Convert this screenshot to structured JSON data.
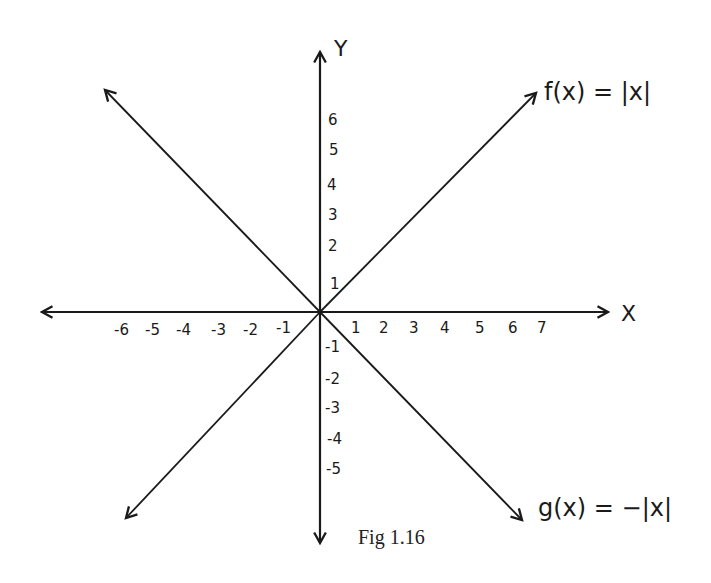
{
  "figure": {
    "caption": "Fig 1.16",
    "x_axis_label": "X",
    "y_axis_label": "Y",
    "functions": [
      {
        "name": "f",
        "label": "f(x) = |x|",
        "expression": "|x|",
        "direction": "V opening upward"
      },
      {
        "name": "g",
        "label": "g(x) = −|x|",
        "expression": "-|x|",
        "direction": "inverted V opening downward"
      }
    ],
    "x_ticks_negative": [
      "-6",
      "-5",
      "-4",
      "-3",
      "-2",
      "-1"
    ],
    "x_ticks_positive": [
      "1",
      "2",
      "3",
      "4",
      "5",
      "6",
      "7"
    ],
    "y_ticks_positive": [
      "1",
      "2",
      "3",
      "4",
      "5",
      "6"
    ],
    "y_ticks_negative": [
      "-1",
      "-2",
      "-3",
      "-4",
      "-5"
    ],
    "line_color": "#1a1a1a"
  }
}
